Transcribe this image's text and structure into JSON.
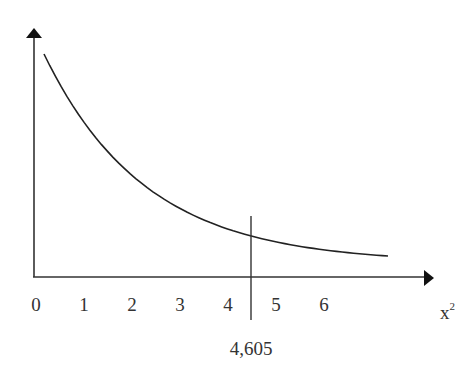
{
  "chart_data": {
    "type": "line",
    "title": "",
    "xlabel": "x²",
    "xlabel_base": "x",
    "xlabel_sup": "2",
    "ylabel": "",
    "x_ticks": [
      "0",
      "1",
      "2",
      "3",
      "4",
      "5",
      "6"
    ],
    "xlim": [
      0,
      8.3
    ],
    "critical_value": 4.605,
    "critical_label": "4,605",
    "series": [
      {
        "name": "chi-square density (decreasing curve)",
        "x": [
          0.2,
          0.5,
          1.0,
          1.5,
          2.0,
          2.5,
          3.0,
          3.5,
          4.0,
          4.605,
          5.0,
          5.5,
          6.0,
          6.5,
          7.0,
          7.4
        ],
        "y": [
          1.0,
          0.9,
          0.76,
          0.64,
          0.54,
          0.45,
          0.38,
          0.32,
          0.28,
          0.23,
          0.2,
          0.17,
          0.14,
          0.12,
          0.11,
          0.1
        ]
      }
    ],
    "grid": false,
    "legend": null
  }
}
